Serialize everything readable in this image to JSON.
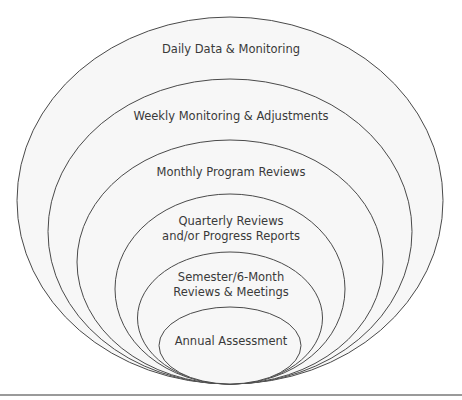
{
  "diagram": {
    "type": "nested-ellipses",
    "stroke_color": "#4a4a4a",
    "fill_color": "#f7f7f7",
    "levels": [
      {
        "label": "Daily Data & Monitoring",
        "cx": 230,
        "cy": 200.5,
        "rx": 213,
        "ry": 183.5,
        "label_top": 42
      },
      {
        "label": "Weekly Monitoring & Adjustments",
        "cx": 230,
        "cy": 231.5,
        "rx": 182,
        "ry": 152.5,
        "label_top": 109
      },
      {
        "label": "Monthly Program Reviews",
        "cx": 230,
        "cy": 262,
        "rx": 153,
        "ry": 122,
        "label_top": 165
      },
      {
        "label": "Quarterly Reviews\nand/or Progress Reports",
        "cx": 230,
        "cy": 289,
        "rx": 115,
        "ry": 95,
        "label_top": 214
      },
      {
        "label": "Semester/6-Month\nReviews & Meetings",
        "cx": 230,
        "cy": 318,
        "rx": 92.5,
        "ry": 66,
        "label_top": 270
      },
      {
        "label": "Annual Assessment",
        "cx": 230,
        "cy": 345.5,
        "rx": 71,
        "ry": 38.5,
        "label_top": 334
      }
    ]
  }
}
